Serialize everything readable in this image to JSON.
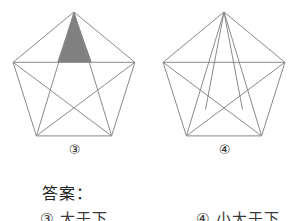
{
  "page": {
    "background_color": "#ffffff",
    "line_color": "#8a8a8a",
    "fill_color": "#808080",
    "text_color": "#222222"
  },
  "figures": [
    {
      "id": "figure-3",
      "label": "③",
      "shape": "pentagon-with-all-diagonals",
      "shaded_region": "top-star-point",
      "shaded": true,
      "extra_apex_lines": false,
      "vertices_note": "regular pentagon, apex at top",
      "geometry": {
        "cx": 74,
        "cy": 76,
        "r": 64,
        "rotation_deg": -90
      }
    },
    {
      "id": "figure-4",
      "label": "④",
      "shape": "pentagon-with-all-diagonals-plus-apex-fan",
      "shaded_region": "",
      "shaded": false,
      "extra_apex_lines": true,
      "vertices_note": "regular pentagon, apex at top, two extra lines from apex to lower-left and lower-right vertices of inner pentagon",
      "geometry": {
        "cx": 74,
        "cy": 76,
        "r": 64,
        "rotation_deg": -90
      }
    }
  ],
  "answer": {
    "heading": "答案：",
    "items": [
      {
        "id": "answer-item-3",
        "text": "③ 大于下"
      },
      {
        "id": "answer-item-4",
        "text": "④ 小大于下"
      }
    ]
  }
}
